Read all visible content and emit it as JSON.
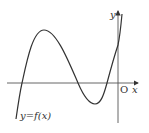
{
  "diagram": {
    "curve_label": "y=f(x)",
    "x_axis_label": "x",
    "y_axis_label": "y",
    "origin_label": "O",
    "colors": {
      "stroke": "#333333",
      "background": "#ffffff"
    }
  }
}
